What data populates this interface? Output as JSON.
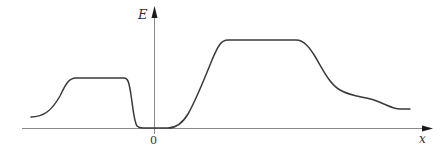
{
  "figure": {
    "axes": {
      "y_label": "E",
      "x_label": "x",
      "origin_label": "0"
    },
    "colors": {
      "axis": "#8a8a8a",
      "curve": "#3a3a3a",
      "arrowhead": "#1a1a1a",
      "background": "#ffffff"
    },
    "curve_features": [
      {
        "name": "left-plateau",
        "x_range_px": [
          72,
          125
        ],
        "y_px": 78
      },
      {
        "name": "zero-well",
        "x_range_px": [
          140,
          172
        ],
        "y_px": 128
      },
      {
        "name": "right-plateau",
        "x_range_px": [
          226,
          298
        ],
        "y_px": 40
      },
      {
        "name": "right-tail-end",
        "x_px": 410,
        "y_px": 109
      }
    ]
  }
}
